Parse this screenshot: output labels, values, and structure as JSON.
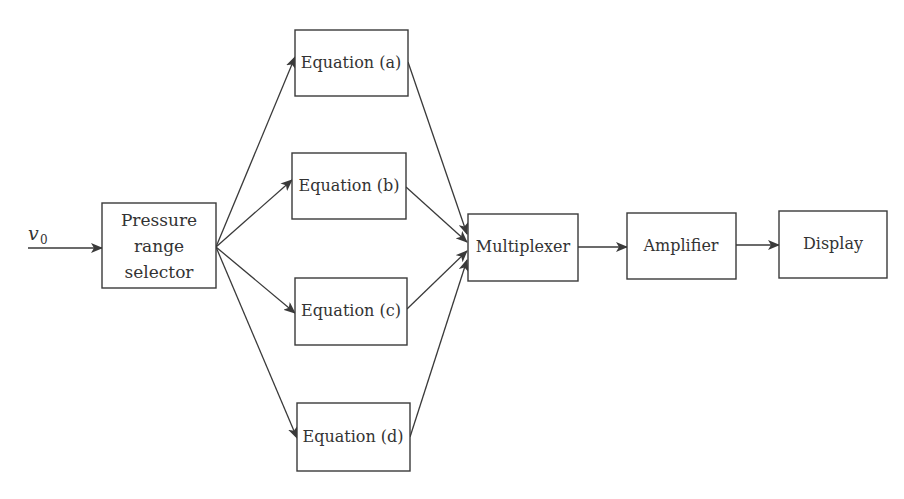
{
  "diagram": {
    "input": {
      "symbol": "v",
      "subscript": "0"
    },
    "blocks": {
      "selector": {
        "lines": [
          "Pressure",
          "range",
          "selector"
        ]
      },
      "eq_a": {
        "label": "Equation (a)"
      },
      "eq_b": {
        "label": "Equation (b)"
      },
      "eq_c": {
        "label": "Equation (c)"
      },
      "eq_d": {
        "label": "Equation (d)"
      },
      "mux": {
        "label": "Multiplexer"
      },
      "amp": {
        "label": "Amplifier"
      },
      "display": {
        "label": "Display"
      }
    },
    "edges": [
      {
        "from": "input",
        "to": "selector"
      },
      {
        "from": "selector",
        "to": "eq_a"
      },
      {
        "from": "selector",
        "to": "eq_b"
      },
      {
        "from": "selector",
        "to": "eq_c"
      },
      {
        "from": "selector",
        "to": "eq_d"
      },
      {
        "from": "eq_a",
        "to": "mux"
      },
      {
        "from": "eq_b",
        "to": "mux"
      },
      {
        "from": "eq_c",
        "to": "mux"
      },
      {
        "from": "eq_d",
        "to": "mux"
      },
      {
        "from": "mux",
        "to": "amp"
      },
      {
        "from": "amp",
        "to": "display"
      }
    ],
    "colors": {
      "stroke": "#3a3a3a",
      "text": "#333333",
      "background": "#ffffff"
    }
  }
}
